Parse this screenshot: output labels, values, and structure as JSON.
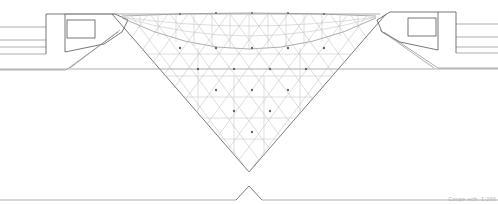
{
  "drawing": {
    "type": "architectural-section",
    "subject": "inverted glass pyramid section",
    "scale_label": "Coupe  ech. 1:200",
    "colors": {
      "line": "#8a8a8a",
      "line_dark": "#555555",
      "node": "#666666",
      "background": "#ffffff"
    }
  }
}
